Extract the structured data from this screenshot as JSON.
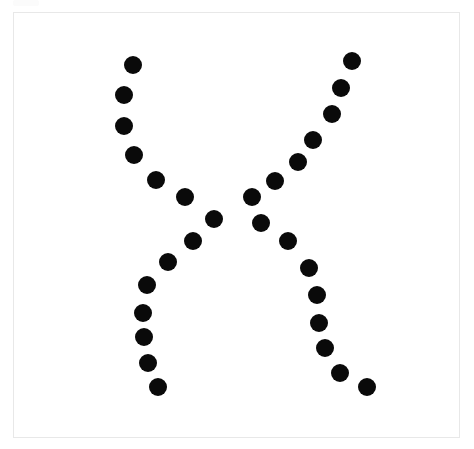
{
  "canvas": {
    "width": 474,
    "height": 449,
    "background_color": "#ffffff",
    "description": "Scanned white page showing a hand-made dotted figure resembling the letter X formed by four curved arms of black round dots"
  },
  "frame": {
    "name": "page-border",
    "x": 13,
    "y": 12,
    "width": 447,
    "height": 426,
    "border_color": "#e8e8e8",
    "border_width": 1,
    "fill_color": "#ffffff"
  },
  "figure": {
    "name": "dotted-x-figure",
    "shape": "X",
    "dot_color": "#0a0a0a",
    "dot_count": 33,
    "dot_diameter": 17,
    "arms": [
      {
        "name": "upper-left-arm",
        "direction": "top-left to center",
        "dot_count": 9,
        "dots": [
          {
            "cx": 133,
            "cy": 65,
            "r": 9
          },
          {
            "cx": 124,
            "cy": 95,
            "r": 9
          },
          {
            "cx": 124,
            "cy": 126,
            "r": 9
          },
          {
            "cx": 134,
            "cy": 155,
            "r": 9
          },
          {
            "cx": 156,
            "cy": 180,
            "r": 9
          },
          {
            "cx": 185,
            "cy": 197,
            "r": 9
          },
          {
            "cx": 214,
            "cy": 219,
            "r": 9
          },
          {
            "cx": 193,
            "cy": 241,
            "r": 9
          },
          {
            "cx": 168,
            "cy": 262,
            "r": 9
          }
        ]
      },
      {
        "name": "lower-left-arm",
        "direction": "center to bottom-left",
        "dot_count": 5,
        "dots": [
          {
            "cx": 147,
            "cy": 285,
            "r": 9
          },
          {
            "cx": 143,
            "cy": 313,
            "r": 9
          },
          {
            "cx": 144,
            "cy": 337,
            "r": 9
          },
          {
            "cx": 148,
            "cy": 363,
            "r": 9
          },
          {
            "cx": 158,
            "cy": 387,
            "r": 9
          }
        ]
      },
      {
        "name": "upper-right-arm",
        "direction": "top-right to center",
        "dot_count": 9,
        "dots": [
          {
            "cx": 352,
            "cy": 61,
            "r": 9
          },
          {
            "cx": 341,
            "cy": 88,
            "r": 9
          },
          {
            "cx": 332,
            "cy": 114,
            "r": 9
          },
          {
            "cx": 313,
            "cy": 140,
            "r": 9
          },
          {
            "cx": 298,
            "cy": 162,
            "r": 9
          },
          {
            "cx": 275,
            "cy": 181,
            "r": 9
          },
          {
            "cx": 252,
            "cy": 197,
            "r": 9
          },
          {
            "cx": 261,
            "cy": 223,
            "r": 9
          },
          {
            "cx": 288,
            "cy": 241,
            "r": 9
          }
        ]
      },
      {
        "name": "lower-right-arm",
        "direction": "center to bottom-right",
        "dot_count": 6,
        "dots": [
          {
            "cx": 309,
            "cy": 268,
            "r": 9
          },
          {
            "cx": 317,
            "cy": 295,
            "r": 9
          },
          {
            "cx": 319,
            "cy": 323,
            "r": 9
          },
          {
            "cx": 325,
            "cy": 348,
            "r": 9
          },
          {
            "cx": 340,
            "cy": 373,
            "r": 9
          },
          {
            "cx": 367,
            "cy": 387,
            "r": 9
          }
        ]
      }
    ]
  }
}
